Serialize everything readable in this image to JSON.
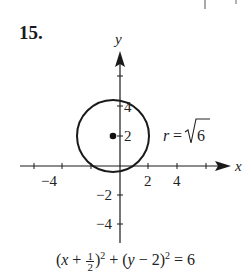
{
  "problem": {
    "number": "15."
  },
  "graph": {
    "x_axis_label": "x",
    "y_axis_label": "y",
    "x_ticks": [
      {
        "value": -6,
        "label": ""
      },
      {
        "value": -4,
        "label": "−4"
      },
      {
        "value": -2,
        "label": ""
      },
      {
        "value": 2,
        "label": "2"
      },
      {
        "value": 4,
        "label": "4"
      },
      {
        "value": 6,
        "label": ""
      }
    ],
    "y_ticks": [
      {
        "value": 6,
        "label": ""
      },
      {
        "value": 4,
        "label": "4"
      },
      {
        "value": 2,
        "label": "2"
      },
      {
        "value": -2,
        "label": "−2"
      },
      {
        "value": -4,
        "label": "−4"
      }
    ],
    "circle": {
      "center_x": -0.5,
      "center_y": 2,
      "radius": 2.449
    },
    "radius_label": "r = √6",
    "colors": {
      "stroke": "#1a1a1a",
      "text": "#222222"
    }
  },
  "equation": {
    "text": "(x + 1/2)² + (y − 2)² = 6",
    "part1": "(",
    "var_x": "x",
    "part2": " + ",
    "frac_num": "1",
    "frac_den": "2",
    "part3": ")",
    "sup1": "2",
    "part4": " + (",
    "var_y": "y",
    "part5": " − 2)",
    "sup2": "2",
    "part6": " = 6"
  },
  "top_fragment": {
    "description": "partial vertical tick marks of previous problem at top right"
  }
}
